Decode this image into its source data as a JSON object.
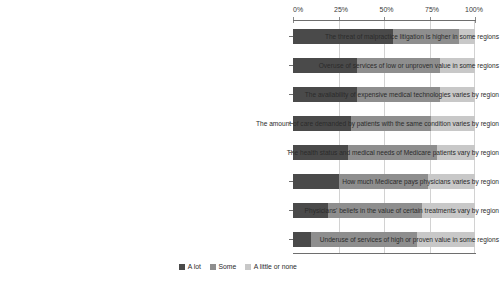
{
  "chart_data": {
    "type": "bar",
    "subtype": "horizontal-stacked-100",
    "title": "",
    "subtitle": "",
    "xlabel": "",
    "ylabel": "",
    "xlim": [
      0,
      100
    ],
    "grid": true,
    "legend_position": "bottom-center",
    "x_ticks": [
      0,
      25,
      50,
      75,
      100
    ],
    "x_tick_labels": [
      "0%",
      "25%",
      "50%",
      "75%",
      "100%"
    ],
    "categories": [
      "The threat of malpractice litigation is higher in some regions",
      "Overuse of services of low or unproven value in some regions",
      "The availability of expensive medical technologies varies by region",
      "The amount of care demanded by patients with the same condition varies by region",
      "The health status and medical needs of Medicare patients vary by region",
      "How much Medicare pays physicians varies by region",
      "Physicians' beliefs in the value of certain treatments vary by region",
      "Underuse of services of high or proven value in some regions"
    ],
    "series": [
      {
        "name": "A lot",
        "color": "#4a4a4a",
        "values": [
          55,
          35,
          35,
          32,
          30,
          25,
          19,
          10
        ]
      },
      {
        "name": "Some",
        "color": "#8e8e8e",
        "values": [
          36,
          46,
          46,
          44,
          49,
          49,
          52,
          58
        ]
      },
      {
        "name": "A little or none",
        "color": "#c8c8c8",
        "values": [
          9,
          19,
          19,
          24,
          21,
          26,
          29,
          32
        ]
      }
    ]
  },
  "legend": {
    "items": [
      {
        "label": "A lot",
        "color": "#4a4a4a"
      },
      {
        "label": "Some",
        "color": "#8e8e8e"
      },
      {
        "label": "A little or none",
        "color": "#c8c8c8"
      }
    ]
  },
  "colors": {
    "a_lot": "#4a4a4a",
    "some": "#8e8e8e",
    "a_little_or_none": "#c8c8c8",
    "axis": "#6e6e6e",
    "gridline": "#d2d2d2",
    "background": "#ffffff",
    "text": "#2b2b2b"
  }
}
